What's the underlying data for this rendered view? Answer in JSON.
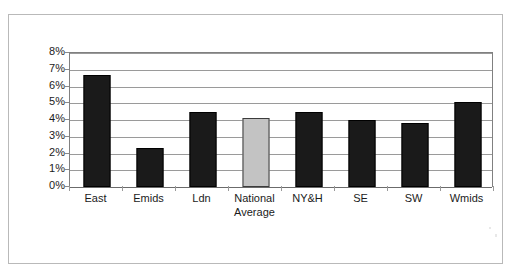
{
  "chart_data": {
    "type": "bar",
    "title": "",
    "xlabel": "",
    "ylabel": "",
    "categories": [
      "East",
      "Emids",
      "Ldn",
      "National Average",
      "NY&H",
      "SE",
      "SW",
      "Wmids"
    ],
    "category_lines": [
      [
        "East"
      ],
      [
        "Emids"
      ],
      [
        "Ldn"
      ],
      [
        "National",
        "Average"
      ],
      [
        "NY&H"
      ],
      [
        "SE"
      ],
      [
        "SW"
      ],
      [
        "Wmids"
      ]
    ],
    "values": [
      6.7,
      2.3,
      4.5,
      4.1,
      4.5,
      4.0,
      3.8,
      5.1
    ],
    "value_labels": [
      "6.7%",
      "2.3%",
      "4.5%",
      "4.1%",
      "4.5%",
      "4.0%",
      "3.8%",
      "5.1%"
    ],
    "bar_styles": [
      "dark",
      "dark",
      "dark",
      "grey",
      "dark",
      "dark",
      "dark",
      "dark"
    ],
    "highlight_category": "National Average",
    "ylim": [
      0,
      8
    ],
    "ytick_values": [
      8,
      7,
      6,
      5,
      4,
      3,
      2,
      1,
      0
    ],
    "ytick_labels": [
      "8%",
      "7%",
      "6%",
      "5%",
      "4%",
      "3%",
      "2%",
      "1%",
      "0%"
    ],
    "grid": true,
    "grid_axis": "y",
    "legend": false,
    "legend_position": "none",
    "colors": {
      "bar_dark": "#1a1a1a",
      "bar_grey": "#c3c3c3",
      "bar_grey_border": "#3c3c3c",
      "gridline": "#9a9a9a",
      "axis": "#808080",
      "frame": "#b9b9b9",
      "text": "#1b1b1b",
      "background": "#ffffff"
    }
  }
}
